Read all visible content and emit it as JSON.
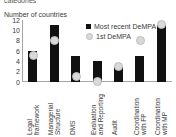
{
  "cropped_heading": "categories",
  "chart_data": {
    "type": "bar",
    "title": "",
    "ylabel": "Number of countries",
    "xlabel": "",
    "ylim": [
      0,
      12
    ],
    "yticks": [
      12,
      10,
      8,
      6,
      4,
      2,
      0
    ],
    "grid": false,
    "legend_position": "top-right",
    "categories": [
      "Legal\nframework",
      "Managerial\nStructure",
      "DMS",
      "Evaluation\nand Reporting",
      "Audit",
      "Coordination\nwith FP",
      "Coordination\nwith MP"
    ],
    "series": [
      {
        "name": "Most recent DeMPA",
        "type": "bar",
        "color": "#111111",
        "values": [
          6,
          11,
          5,
          4,
          3,
          5,
          11
        ]
      },
      {
        "name": "1st DeMPA",
        "type": "scatter",
        "color": "#d9d9d9",
        "values": [
          5,
          8,
          1,
          0,
          3,
          8,
          11
        ]
      }
    ]
  }
}
